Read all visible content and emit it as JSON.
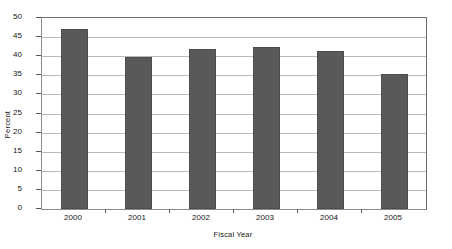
{
  "chart_data": {
    "type": "bar",
    "title": "",
    "subtitle": "",
    "xlabel": "Fiscal Year",
    "ylabel": "Percent",
    "categories": [
      "2000",
      "2001",
      "2002",
      "2003",
      "2004",
      "2005"
    ],
    "values": [
      47.2,
      39.8,
      42.0,
      42.5,
      41.4,
      35.4
    ],
    "series": [
      {
        "name": "Percent",
        "values": [
          47.2,
          39.8,
          42.0,
          42.5,
          41.4,
          35.4
        ]
      }
    ],
    "ylim": [
      0,
      50
    ],
    "ytick_step": 5,
    "ytick_labels": [
      "0",
      "5",
      "10",
      "15",
      "20",
      "25",
      "30",
      "35",
      "40",
      "45",
      "50"
    ],
    "ytick_values": [
      0,
      5,
      10,
      15,
      20,
      25,
      30,
      35,
      40,
      45,
      50
    ],
    "grid": true,
    "grid_axis": "y",
    "legend": false,
    "legend_position": "none",
    "bar_color": "#595959",
    "bar_border_color": "#4d4d4d",
    "gridline_color": "#b9b9b9",
    "axis_color": "#6e6e6e",
    "background_color": "#ffffff",
    "annotations": []
  }
}
